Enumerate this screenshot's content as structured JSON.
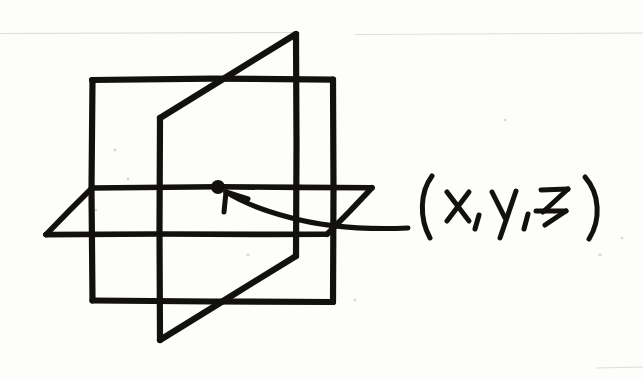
{
  "figure": {
    "kind": "hand-drawn-sketch",
    "medium": "ink on paper, scanned",
    "background_color": "#fdfdfb",
    "ink_color": "#131110"
  },
  "annotation": {
    "point_label": "(x , y , z)",
    "label_open_paren": "(",
    "label_x": "x",
    "label_comma_1": ",",
    "label_y": "y",
    "label_comma_2": ",",
    "label_z": "z",
    "label_close_paren": ")",
    "arrow_description": "curved arrow pointing up-left from the label toward the marked point",
    "point_marker": "filled dot"
  },
  "geometry": {
    "planes": [
      {
        "name": "back-vertical-plane",
        "description": "upright rectangle forming the back wall",
        "outline": "92,79 333,79 333,302 92,300"
      },
      {
        "name": "horizontal-plane",
        "description": "floor plane drawn as a parallelogram receding to the upper right",
        "outline": "46,234 92,187 372,187 327,234"
      },
      {
        "name": "side-vertical-plane",
        "description": "upright plane seen edge-on slicing front to back through the other two",
        "outline": "296,33 160,118 160,340 296,256"
      }
    ],
    "marked_point": {
      "x": 218,
      "y": 187,
      "radius": 6.5
    }
  },
  "colors": {
    "ink": "#131110",
    "paper": "#fdfdfb",
    "scan_speck": "#d9d6d1",
    "faint_rule": "#dedcd8"
  }
}
